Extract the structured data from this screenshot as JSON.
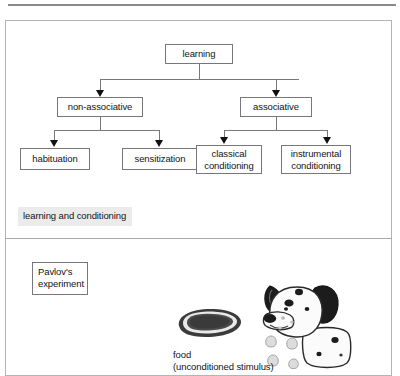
{
  "figure": {
    "upper_panel": {
      "caption": "learning and conditioning",
      "diagram_type": "hierarchy-tree",
      "nodes": {
        "root": "learning",
        "level2": [
          "non-associative",
          "associative"
        ],
        "level3": [
          "habituation",
          "sensitization",
          "classical\nconditioning",
          "instrumental\nconditioning"
        ]
      },
      "node_labels": {
        "learning": "learning",
        "non_associative": "non-associative",
        "associative": "associative",
        "habituation": "habituation",
        "sensitization": "sensitization",
        "classical_conditioning": "classical conditioning",
        "instrumental_conditioning": "instrumental conditioning"
      }
    },
    "lower_panel": {
      "caption": "Pavlov's experiment",
      "food_label_line1": "food",
      "food_label_line2": "(unconditioned stimulus)",
      "illustrations": [
        "food-bowl",
        "dalmatian-dog-drooling"
      ]
    }
  },
  "colors": {
    "page_background": "#ffffff",
    "frame_border": "#b4b4b4",
    "node_border": "#777777",
    "connector": "#777777",
    "arrowhead": "#111111",
    "caption_highlight": "#ebebeb",
    "text": "#141414",
    "top_rule": "#8a8a8a",
    "food_dark": "#3b3b3b",
    "dog_black": "#1c1c1c",
    "dog_white": "#fbfbfb",
    "drool": "#d8d8d8"
  }
}
